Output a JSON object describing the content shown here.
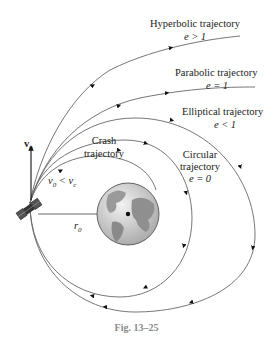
{
  "figure": {
    "caption": "Fig. 13–25",
    "trajectories": [
      {
        "id": "hyperbolic",
        "name": "Hyperbolic trajectory",
        "condition": "e > 1"
      },
      {
        "id": "parabolic",
        "name": "Parabolic trajectory",
        "condition": "e = 1"
      },
      {
        "id": "elliptical",
        "name": "Elliptical trajectory",
        "condition": "e < 1"
      },
      {
        "id": "circular",
        "name_line1": "Circular",
        "name_line2": "trajectory",
        "condition": "e = 0"
      },
      {
        "id": "crash",
        "name_line1": "Crash",
        "name_line2": "trajectory",
        "condition": "v0 < vc"
      }
    ],
    "labels": {
      "velocity_vector": "v",
      "velocity_sub": "0",
      "radius": "r",
      "radius_sub": "0",
      "crash_v": "v",
      "crash_v_sub": "0",
      "crash_lt": " < ",
      "crash_vc": "v",
      "crash_vc_sub": "c"
    },
    "colors": {
      "curve": "#555555",
      "earth_ocean": "#cfcfcf",
      "earth_land": "#8a8a8a",
      "caption": "#8a8a8a"
    }
  }
}
